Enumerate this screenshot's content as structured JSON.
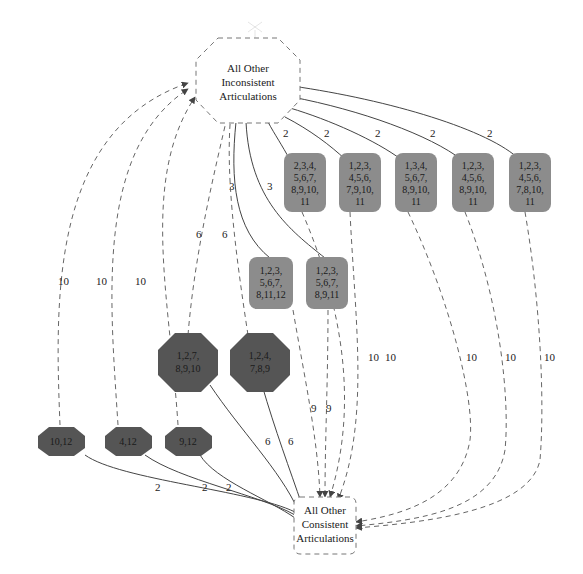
{
  "diagram": {
    "colors": {
      "background": "#ffffff",
      "gray_node_fill": "#8c8c8c",
      "dark_node_fill": "#555555",
      "edge_solid": "#444444",
      "edge_dashed": "#666666",
      "text": "#1a1a1a"
    },
    "top_node": {
      "shape": "octagon-dashed",
      "lines": [
        "All Other",
        "Inconsistent",
        "Articulations"
      ]
    },
    "bottom_node": {
      "shape": "rounded-rect-dashed",
      "lines": [
        "All Other",
        "Consistent",
        "Articulations"
      ]
    },
    "gray_nodes_row1": [
      {
        "lines": [
          "2,3,4,",
          "5,6,7,",
          "8,9,10,",
          "11"
        ],
        "in_label": "2",
        "out_label": "10"
      },
      {
        "lines": [
          "1,2,3,",
          "4,5,6,",
          "7,9,10,",
          "11"
        ],
        "in_label": "2",
        "out_label": "10"
      },
      {
        "lines": [
          "1,3,4,",
          "5,6,7,",
          "8,9,10,",
          "11"
        ],
        "in_label": "2",
        "out_label": "10"
      },
      {
        "lines": [
          "1,2,3,",
          "4,5,6,",
          "8,9,10,",
          "11"
        ],
        "in_label": "2",
        "out_label": "10"
      },
      {
        "lines": [
          "1,2,3,",
          "4,5,6,",
          "7,8,10,",
          "11"
        ],
        "in_label": "2",
        "out_label": "10"
      }
    ],
    "gray_nodes_row2": [
      {
        "lines": [
          "1,2,3,",
          "5,6,7,",
          "8,11,12"
        ],
        "in_label": "3",
        "out_label": "9"
      },
      {
        "lines": [
          "1,2,3,",
          "5,6,7,",
          "8,9,11"
        ],
        "in_label": "3",
        "out_label": "9"
      }
    ],
    "dark_nodes_large": [
      {
        "lines": [
          "1,2,7,",
          "8,9,10"
        ],
        "up_label": "6",
        "down_label": "6"
      },
      {
        "lines": [
          "1,2,4,",
          "7,8,9"
        ],
        "up_label": "6",
        "down_label": "6"
      }
    ],
    "dark_nodes_small": [
      {
        "lines": [
          "10,12"
        ],
        "up_label": "10",
        "down_label": "2"
      },
      {
        "lines": [
          "4,12"
        ],
        "up_label": "10",
        "down_label": "2"
      },
      {
        "lines": [
          "9,12"
        ],
        "up_label": "10",
        "down_label": "2"
      }
    ]
  }
}
